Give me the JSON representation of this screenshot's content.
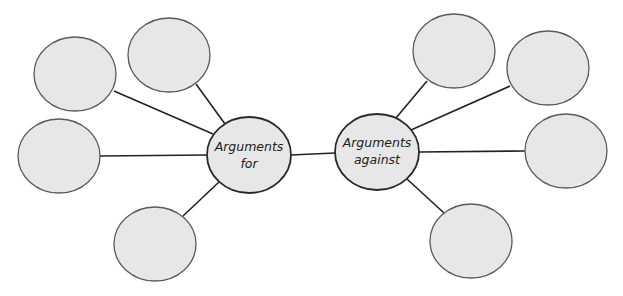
{
  "diagram": {
    "type": "double-spider-map",
    "colors": {
      "background": "#ffffff",
      "node_fill": "#e7e7e7",
      "outer_stroke": "#5a5a5a",
      "center_stroke": "#2a2a2a",
      "connector": "#222222",
      "text": "#222222"
    },
    "centers": [
      {
        "id": "for",
        "line1": "Arguments",
        "line2": "for",
        "cx": 249,
        "cy": 155,
        "rx": 42,
        "ry": 38
      },
      {
        "id": "against",
        "line1": "Arguments",
        "line2": "against",
        "cx": 377,
        "cy": 152,
        "rx": 42,
        "ry": 38
      }
    ],
    "outer_nodes": {
      "for": [
        {
          "cx": 75,
          "cy": 74,
          "rx": 41,
          "ry": 37,
          "text": ""
        },
        {
          "cx": 169,
          "cy": 55,
          "rx": 41,
          "ry": 37,
          "text": ""
        },
        {
          "cx": 59,
          "cy": 156,
          "rx": 41,
          "ry": 37,
          "text": ""
        },
        {
          "cx": 155,
          "cy": 244,
          "rx": 41,
          "ry": 37,
          "text": ""
        }
      ],
      "against": [
        {
          "cx": 454,
          "cy": 51,
          "rx": 41,
          "ry": 37,
          "text": ""
        },
        {
          "cx": 548,
          "cy": 68,
          "rx": 41,
          "ry": 37,
          "text": ""
        },
        {
          "cx": 566,
          "cy": 151,
          "rx": 41,
          "ry": 37,
          "text": ""
        },
        {
          "cx": 471,
          "cy": 241,
          "rx": 41,
          "ry": 37,
          "text": ""
        }
      ]
    }
  }
}
